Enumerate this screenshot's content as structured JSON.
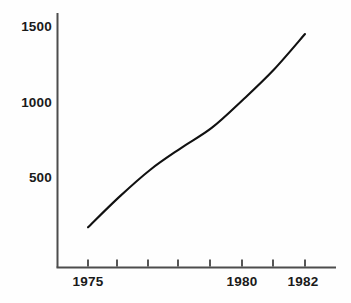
{
  "chart_data": {
    "type": "line",
    "title": "",
    "subtitle": "",
    "xlabel": "",
    "ylabel": "",
    "x": [
      1975,
      1976,
      1977,
      1978,
      1979,
      1980,
      1981,
      1982
    ],
    "values": [
      170,
      370,
      550,
      695,
      830,
      1015,
      1215,
      1450
    ],
    "series": [
      {
        "name": "",
        "values": [
          170,
          370,
          550,
          695,
          830,
          1015,
          1215,
          1450
        ]
      }
    ],
    "xlim": [
      1974.7,
      1982.3
    ],
    "ylim": [
      0,
      1560
    ],
    "y_ticks": [
      500,
      1000,
      1500
    ],
    "y_tick_labels": [
      "500",
      "1000",
      "1500"
    ],
    "x_ticks": [
      1975,
      1976,
      1977,
      1978,
      1979,
      1980,
      1981,
      1982
    ],
    "x_tick_labels": [
      "1975",
      "",
      "",
      "",
      "",
      "1980",
      "",
      "1982"
    ],
    "grid": false,
    "legend": "none",
    "annotations": [],
    "line_color": "#111111",
    "axis_color": "#4d4d4d",
    "background_color": "#fefefe"
  },
  "axes": {
    "y_labels": [
      {
        "text": "1500",
        "top": 20
      },
      {
        "text": "1000",
        "top": 96
      },
      {
        "text": "500",
        "top": 171
      }
    ],
    "x_labels": [
      {
        "text": "1975",
        "left": 62
      },
      {
        "text": "1980",
        "left": 217
      },
      {
        "text": "1982",
        "left": 277
      }
    ]
  }
}
